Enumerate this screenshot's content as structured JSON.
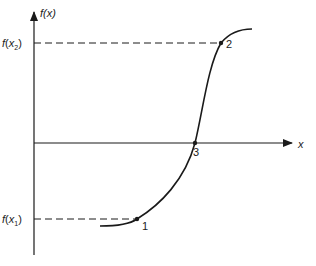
{
  "diagram": {
    "y_axis_label": "f(x)",
    "x_axis_label": "x",
    "y_tick_labels": {
      "upper": {
        "f": "f",
        "open": "(",
        "x": "x",
        "sub": "2",
        "close": ")"
      },
      "lower": {
        "f": "f",
        "open": "(",
        "x": "x",
        "sub": "1",
        "close": ")"
      }
    },
    "points": [
      {
        "id": "1",
        "label": "1"
      },
      {
        "id": "2",
        "label": "2"
      },
      {
        "id": "3",
        "label": "3"
      }
    ],
    "colors": {
      "stroke": "#1a1a1a",
      "background": "#ffffff"
    }
  }
}
